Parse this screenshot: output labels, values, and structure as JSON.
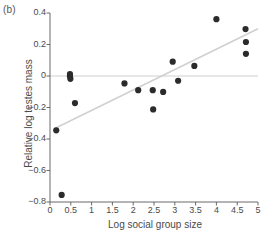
{
  "panel": {
    "label": "(b)"
  },
  "chart_data": {
    "type": "scatter",
    "title": "",
    "xlabel": "Log social group size",
    "ylabel": "Relative log testes mass",
    "xlim": [
      0,
      5
    ],
    "ylim": [
      -0.8,
      0.4
    ],
    "xticks": [
      0,
      0.5,
      1,
      1.5,
      2,
      2.5,
      3,
      3.5,
      4,
      4.5,
      5
    ],
    "xtick_labels": [
      "0",
      "0.5",
      "1",
      "1.5",
      "2",
      "2.5",
      "3",
      "3.5",
      "4",
      "4.5",
      "5"
    ],
    "yticks": [
      0.4,
      0.2,
      0,
      -0.2,
      -0.4,
      -0.6,
      -0.8
    ],
    "ytick_labels": [
      "0.4",
      "0.2",
      "0",
      "−0.2",
      "−0.4",
      "−0.6",
      "−0.8"
    ],
    "grid": false,
    "legend": null,
    "marker_color": "#2b2b2b",
    "marker_size": 3.1,
    "points": [
      {
        "x": 0.15,
        "y": -0.345
      },
      {
        "x": 0.28,
        "y": -0.755
      },
      {
        "x": 0.48,
        "y": 0.012
      },
      {
        "x": 0.48,
        "y": -0.002
      },
      {
        "x": 0.49,
        "y": -0.018
      },
      {
        "x": 0.6,
        "y": -0.172
      },
      {
        "x": 1.79,
        "y": -0.047
      },
      {
        "x": 2.12,
        "y": -0.09
      },
      {
        "x": 2.47,
        "y": -0.09
      },
      {
        "x": 2.48,
        "y": -0.212
      },
      {
        "x": 2.72,
        "y": -0.101
      },
      {
        "x": 2.95,
        "y": 0.091
      },
      {
        "x": 3.08,
        "y": -0.03
      },
      {
        "x": 3.47,
        "y": 0.064
      },
      {
        "x": 4.0,
        "y": 0.361
      },
      {
        "x": 4.7,
        "y": 0.298
      },
      {
        "x": 4.71,
        "y": 0.216
      },
      {
        "x": 4.71,
        "y": 0.141
      }
    ],
    "reference_line": {
      "name": "zero-line",
      "orientation": "horizontal",
      "y": 0,
      "color": "#c9c9c9",
      "x_from": 0,
      "x_to": 5
    },
    "trend_line": {
      "name": "regression-line",
      "color": "#d0d0d0",
      "x_from": 0.1,
      "y_from": -0.335,
      "x_to": 5.0,
      "y_to": 0.3
    },
    "axis_color": "#5a5a5a"
  }
}
